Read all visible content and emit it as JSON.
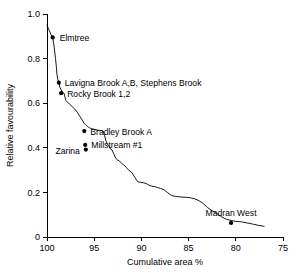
{
  "chart_data": {
    "type": "line",
    "title": "",
    "xlabel": "Cumulative area %",
    "ylabel": "Relative favourability",
    "xlim": [
      100,
      75
    ],
    "ylim": [
      0,
      1.0
    ],
    "xticks": [
      100,
      95,
      90,
      85,
      80,
      75
    ],
    "xtick_labels": [
      "100",
      "95",
      "90",
      "85",
      "80",
      "75"
    ],
    "yticks": [
      0,
      0.2,
      0.4,
      0.6,
      0.8,
      1.0
    ],
    "ytick_labels": [
      "0",
      "0.2",
      "0.4",
      "0.6",
      "0.8",
      "1.0"
    ],
    "grid": false,
    "legend": "none",
    "x_axis_reversed": true,
    "series": [
      {
        "name": "Relative favourability curve",
        "x": [
          100.0,
          99.95,
          99.9,
          99.8,
          99.7,
          99.55,
          99.4,
          99.25,
          99.1,
          99.0,
          98.95,
          98.85,
          98.75,
          98.7,
          98.65,
          98.5,
          98.35,
          98.2,
          98.1,
          98.0,
          97.6,
          97.2,
          96.8,
          96.5,
          96.2,
          96.05,
          95.95,
          95.9,
          95.8,
          95.75,
          95.7,
          95.6,
          95.5,
          95.35,
          95.2,
          95.0,
          94.8,
          94.6,
          94.4,
          94.2,
          94.05,
          93.9,
          93.75,
          93.6,
          93.45,
          93.3,
          93.1,
          92.9,
          92.7,
          92.5,
          92.3,
          92.1,
          91.9,
          91.6,
          91.3,
          91.0,
          90.7,
          90.4,
          90.1,
          89.8,
          89.5,
          89.2,
          88.9,
          88.6,
          88.3,
          88.0,
          87.6,
          87.2,
          86.8,
          86.4,
          86.0,
          85.6,
          85.2,
          84.8,
          84.4,
          84.0,
          83.5,
          83.0,
          82.5,
          82.0,
          81.5,
          81.0,
          80.5,
          80.0,
          79.4,
          78.8,
          78.2,
          77.6,
          77.0
        ],
        "y": [
          0.95,
          0.945,
          0.94,
          0.93,
          0.92,
          0.905,
          0.895,
          0.855,
          0.8,
          0.76,
          0.73,
          0.705,
          0.692,
          0.69,
          0.672,
          0.66,
          0.648,
          0.645,
          0.628,
          0.612,
          0.595,
          0.58,
          0.56,
          0.54,
          0.52,
          0.508,
          0.505,
          0.503,
          0.5,
          0.498,
          0.495,
          0.492,
          0.49,
          0.487,
          0.485,
          0.483,
          0.481,
          0.479,
          0.478,
          0.477,
          0.475,
          0.455,
          0.43,
          0.415,
          0.41,
          0.395,
          0.39,
          0.37,
          0.352,
          0.345,
          0.34,
          0.33,
          0.325,
          0.312,
          0.298,
          0.288,
          0.268,
          0.248,
          0.245,
          0.243,
          0.24,
          0.232,
          0.228,
          0.226,
          0.222,
          0.218,
          0.212,
          0.198,
          0.186,
          0.182,
          0.18,
          0.179,
          0.178,
          0.176,
          0.172,
          0.165,
          0.152,
          0.132,
          0.118,
          0.105,
          0.09,
          0.08,
          0.074,
          0.07,
          0.068,
          0.063,
          0.058,
          0.052,
          0.048
        ]
      }
    ],
    "annotations": [
      {
        "label": "Elmtree",
        "x": 99.4,
        "y": 0.895,
        "label_dx": 7,
        "label_dy": 3.5,
        "anchor": "start"
      },
      {
        "label": "Lavigna Brook A,B, Stephens Brook",
        "x": 98.75,
        "y": 0.692,
        "label_dx": 6,
        "label_dy": 3.5,
        "anchor": "start"
      },
      {
        "label": "Rocky Brook 1,2",
        "x": 98.5,
        "y": 0.645,
        "label_dx": 6,
        "label_dy": 3.5,
        "anchor": "start"
      },
      {
        "label": "Bradley Brook A",
        "x": 96.05,
        "y": 0.475,
        "label_dx": 6,
        "label_dy": 3.5,
        "anchor": "start"
      },
      {
        "label": "Millstream  #1",
        "x": 95.95,
        "y": 0.413,
        "label_dx": 6,
        "label_dy": 3.0,
        "anchor": "start"
      },
      {
        "label": "Zarina",
        "x": 95.88,
        "y": 0.392,
        "label_dx": -6,
        "label_dy": 4.0,
        "anchor": "end"
      },
      {
        "label": "Madran West",
        "x": 80.5,
        "y": 0.063,
        "label_dx": 0,
        "label_dy": -7,
        "anchor": "middle"
      }
    ]
  }
}
